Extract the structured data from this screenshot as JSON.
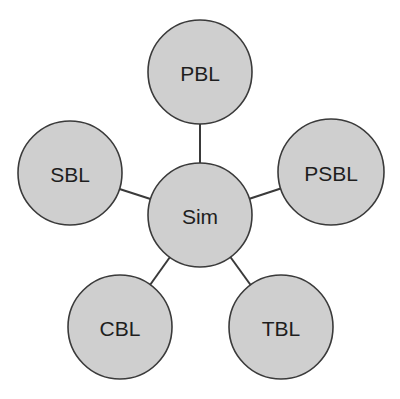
{
  "diagram": {
    "type": "hub-and-spoke",
    "center": {
      "id": "sim",
      "label": "Sim",
      "cx": 200,
      "cy": 215,
      "r": 52
    },
    "nodes": [
      {
        "id": "pbl",
        "label": "PBL",
        "cx": 200,
        "cy": 72,
        "r": 52
      },
      {
        "id": "sbl",
        "label": "SBL",
        "cx": 70,
        "cy": 173,
        "r": 52
      },
      {
        "id": "psbl",
        "label": "PSBL",
        "cx": 331,
        "cy": 172,
        "r": 53
      },
      {
        "id": "cbl",
        "label": "CBL",
        "cx": 120,
        "cy": 327,
        "r": 52
      },
      {
        "id": "tbl",
        "label": "TBL",
        "cx": 281,
        "cy": 327,
        "r": 52
      }
    ],
    "edges": [
      {
        "from": "sim",
        "to": "pbl"
      },
      {
        "from": "sim",
        "to": "sbl"
      },
      {
        "from": "sim",
        "to": "psbl"
      },
      {
        "from": "sim",
        "to": "cbl"
      },
      {
        "from": "sim",
        "to": "tbl"
      }
    ],
    "colors": {
      "fill": "#cfcfcf",
      "stroke": "#3a3a3a",
      "text": "#1e1e1e"
    }
  }
}
